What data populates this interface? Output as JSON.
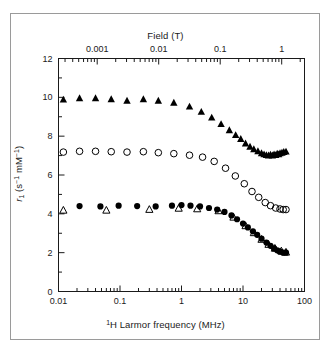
{
  "figure": {
    "background": "#ffffff",
    "border_color": "#9a9a9a",
    "ink_color": "#1a1a1a"
  },
  "axes": {
    "top": {
      "title": "Field (T)",
      "ticks": [
        "0.001",
        "0.01",
        "0.1",
        "1"
      ],
      "tick_values": [
        0.001,
        0.01,
        0.1,
        1
      ],
      "scale": "log",
      "direction": "inward"
    },
    "bottom": {
      "title_prefix": "1",
      "title": "H Larmor frequency (MHz)",
      "title_full": "1H Larmor frequency (MHz)",
      "ticks": [
        "0.01",
        "0.1",
        "1",
        "10",
        "100"
      ],
      "tick_values": [
        0.01,
        0.1,
        1,
        10,
        100
      ],
      "scale": "log",
      "direction": "inward"
    },
    "left": {
      "title": "r1 (s-1 mM-1)",
      "title_base": "r",
      "title_sub": "1",
      "title_unit_open": " (s",
      "title_unit_sup1": "−1",
      "title_unit_mid": " mM",
      "title_unit_sup2": "−1",
      "title_unit_close": ")",
      "ticks": [
        "0",
        "2",
        "4",
        "6",
        "8",
        "10",
        "12"
      ],
      "tick_values": [
        0,
        2,
        4,
        6,
        8,
        10,
        12
      ],
      "scale": "linear",
      "direction": "inward"
    }
  },
  "chart_data": {
    "type": "scatter",
    "title": "",
    "xlabel": "1H Larmor frequency (MHz)",
    "ylabel": "r1 (s-1 mM-1)",
    "xscale": "log",
    "yscale": "linear",
    "xlim": [
      0.01,
      100
    ],
    "ylim": [
      0,
      12
    ],
    "secondary_xaxis": {
      "label": "Field (T)",
      "xlim": [
        0.000234,
        2.34
      ],
      "conversion": "42.577 MHz per T"
    },
    "grid": false,
    "legend": "none",
    "series": [
      {
        "name": "filled-triangles",
        "marker": "triangle-filled",
        "color": "#000000",
        "points": [
          [
            0.012,
            9.88
          ],
          [
            0.022,
            9.95
          ],
          [
            0.04,
            9.95
          ],
          [
            0.072,
            9.9
          ],
          [
            0.13,
            9.82
          ],
          [
            0.24,
            9.9
          ],
          [
            0.42,
            9.82
          ],
          [
            0.75,
            9.72
          ],
          [
            1.35,
            9.52
          ],
          [
            2.1,
            9.25
          ],
          [
            3.1,
            8.95
          ],
          [
            4.4,
            8.62
          ],
          [
            6.0,
            8.3
          ],
          [
            7.6,
            8.05
          ],
          [
            9.2,
            7.85
          ],
          [
            11.0,
            7.62
          ],
          [
            13.0,
            7.45
          ],
          [
            15.0,
            7.32
          ],
          [
            17.5,
            7.22
          ],
          [
            20.0,
            7.12
          ],
          [
            22.0,
            7.06
          ],
          [
            24.0,
            7.02
          ],
          [
            26.0,
            7.0
          ],
          [
            28.0,
            7.04
          ],
          [
            30.0,
            7.0
          ],
          [
            32.0,
            7.06
          ],
          [
            34.0,
            7.02
          ],
          [
            36.0,
            7.1
          ],
          [
            38.0,
            7.06
          ],
          [
            40.0,
            7.12
          ],
          [
            43.0,
            7.14
          ],
          [
            46.0,
            7.18
          ],
          [
            50.0,
            7.2
          ]
        ]
      },
      {
        "name": "open-circles",
        "marker": "circle-open",
        "color": "#000000",
        "points": [
          [
            0.012,
            7.18
          ],
          [
            0.022,
            7.22
          ],
          [
            0.04,
            7.22
          ],
          [
            0.072,
            7.2
          ],
          [
            0.13,
            7.18
          ],
          [
            0.24,
            7.2
          ],
          [
            0.42,
            7.15
          ],
          [
            0.75,
            7.1
          ],
          [
            1.35,
            7.02
          ],
          [
            2.2,
            6.92
          ],
          [
            3.4,
            6.7
          ],
          [
            5.2,
            6.35
          ],
          [
            7.5,
            5.95
          ],
          [
            10.5,
            5.55
          ],
          [
            14.0,
            5.15
          ],
          [
            18.0,
            4.85
          ],
          [
            23.0,
            4.58
          ],
          [
            28.0,
            4.42
          ],
          [
            34.0,
            4.3
          ],
          [
            40.0,
            4.25
          ],
          [
            45.0,
            4.22
          ],
          [
            50.0,
            4.22
          ]
        ]
      },
      {
        "name": "filled-circles",
        "marker": "circle-filled",
        "color": "#000000",
        "points": [
          [
            0.022,
            4.4
          ],
          [
            0.048,
            4.38
          ],
          [
            0.095,
            4.42
          ],
          [
            0.19,
            4.4
          ],
          [
            0.38,
            4.38
          ],
          [
            0.7,
            4.42
          ],
          [
            1.0,
            4.45
          ],
          [
            1.4,
            4.42
          ],
          [
            2.0,
            4.38
          ],
          [
            2.8,
            4.3
          ],
          [
            3.8,
            4.22
          ],
          [
            5.0,
            4.1
          ],
          [
            6.5,
            3.92
          ],
          [
            8.0,
            3.72
          ],
          [
            10.0,
            3.5
          ],
          [
            12.0,
            3.3
          ],
          [
            14.5,
            3.1
          ],
          [
            17.0,
            2.92
          ],
          [
            20.0,
            2.72
          ],
          [
            24.0,
            2.52
          ],
          [
            28.0,
            2.35
          ],
          [
            32.0,
            2.22
          ],
          [
            36.0,
            2.12
          ],
          [
            40.0,
            2.05
          ],
          [
            45.0,
            2.0
          ],
          [
            50.0,
            2.0
          ]
        ]
      },
      {
        "name": "open-triangles",
        "marker": "triangle-open",
        "color": "#000000",
        "points": [
          [
            0.012,
            4.18
          ],
          [
            0.06,
            4.18
          ],
          [
            0.3,
            4.22
          ],
          [
            0.9,
            4.28
          ],
          [
            1.8,
            4.25
          ],
          [
            4.0,
            4.15
          ],
          [
            7.0,
            3.82
          ],
          [
            11.0,
            3.38
          ],
          [
            15.0,
            3.02
          ],
          [
            20.0,
            2.68
          ],
          [
            26.0,
            2.42
          ],
          [
            33.0,
            2.22
          ],
          [
            42.0,
            2.08
          ],
          [
            50.0,
            2.02
          ]
        ]
      }
    ]
  }
}
